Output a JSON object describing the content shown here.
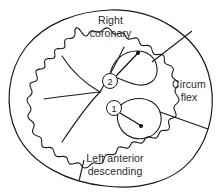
{
  "diagram": {
    "type": "anatomical-line-diagram",
    "background_color": "#ffffff",
    "stroke_color": "#1a1a1a",
    "text_color": "#2b2b2b",
    "width": 221,
    "height": 195,
    "territories": [
      {
        "id": "right-coronary",
        "label_line1": "Right",
        "label_line2": "coronary",
        "position": "top-center"
      },
      {
        "id": "circumflex",
        "label_line1": "Circum",
        "label_line2": "flex",
        "position": "right"
      },
      {
        "id": "left-anterior-descending",
        "label_line1": "Left anterior",
        "label_line2": "descending",
        "position": "bottom-center"
      }
    ],
    "markers": [
      {
        "id": "marker-2",
        "number": "2",
        "circle_x": 110,
        "circle_y": 81,
        "radius": 7.5,
        "dot_x": 138,
        "dot_y": 53
      },
      {
        "id": "marker-1",
        "number": "1",
        "circle_x": 114,
        "circle_y": 108,
        "radius": 7.5,
        "dot_x": 141,
        "dot_y": 126
      }
    ],
    "dividers": [
      {
        "id": "divider-upper-right",
        "x1": 152,
        "y1": 62,
        "x2": 192,
        "y2": 31
      },
      {
        "id": "divider-lower-right",
        "x1": 160,
        "y1": 112,
        "x2": 208,
        "y2": 129
      },
      {
        "id": "divider-bottom-left",
        "x1": 84,
        "y1": 160,
        "x2": 79,
        "y2": 181
      }
    ]
  }
}
